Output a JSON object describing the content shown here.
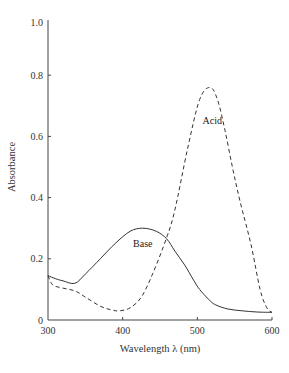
{
  "chart_data": {
    "type": "line",
    "title": "",
    "xlabel": "Wavelength λ (nm)",
    "ylabel": "Absorbance",
    "xlim": [
      300,
      600
    ],
    "ylim": [
      0,
      1.0
    ],
    "x_ticks": [
      300,
      400,
      500,
      600
    ],
    "x_tick_labels": [
      "300",
      "400",
      "500",
      "600"
    ],
    "y_ticks": [
      0,
      0.2,
      0.4,
      0.6,
      0.8,
      1.0
    ],
    "y_tick_labels": [
      "0",
      "0.2",
      "0.4",
      "0.6",
      "0.8",
      "1.0"
    ],
    "grid": false,
    "legend": "none (curves labeled inline)",
    "series": [
      {
        "name": "Base",
        "style": "solid",
        "label_position": {
          "x": 427,
          "y": 0.24
        },
        "points": [
          [
            300,
            0.145
          ],
          [
            310,
            0.135
          ],
          [
            320,
            0.128
          ],
          [
            336,
            0.12
          ],
          [
            350,
            0.15
          ],
          [
            370,
            0.2
          ],
          [
            390,
            0.25
          ],
          [
            410,
            0.29
          ],
          [
            427,
            0.3
          ],
          [
            445,
            0.29
          ],
          [
            459,
            0.265
          ],
          [
            470,
            0.225
          ],
          [
            483,
            0.18
          ],
          [
            495,
            0.13
          ],
          [
            503,
            0.1
          ],
          [
            515,
            0.068
          ],
          [
            524,
            0.05
          ],
          [
            541,
            0.036
          ],
          [
            560,
            0.03
          ],
          [
            580,
            0.026
          ],
          [
            600,
            0.025
          ]
        ]
      },
      {
        "name": "Acid",
        "style": "dashed",
        "label_position": {
          "x": 520,
          "y": 0.64
        },
        "points": [
          [
            300,
            0.145
          ],
          [
            306,
            0.115
          ],
          [
            315,
            0.107
          ],
          [
            336,
            0.095
          ],
          [
            350,
            0.075
          ],
          [
            370,
            0.045
          ],
          [
            385,
            0.033
          ],
          [
            396,
            0.03
          ],
          [
            410,
            0.04
          ],
          [
            425,
            0.075
          ],
          [
            440,
            0.15
          ],
          [
            459,
            0.27
          ],
          [
            470,
            0.36
          ],
          [
            487,
            0.56
          ],
          [
            503,
            0.72
          ],
          [
            517,
            0.76
          ],
          [
            527,
            0.72
          ],
          [
            537,
            0.62
          ],
          [
            547,
            0.5
          ],
          [
            557,
            0.39
          ],
          [
            572,
            0.245
          ],
          [
            584,
            0.1
          ],
          [
            593,
            0.04
          ],
          [
            600,
            0.025
          ]
        ]
      }
    ]
  },
  "colors": {
    "axis": "#444444",
    "curve": "#333333",
    "background": "#ffffff"
  }
}
